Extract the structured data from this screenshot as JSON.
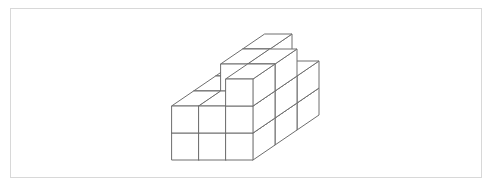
{
  "figure": {
    "kind": "line-drawing",
    "frame": {
      "visible": true,
      "border_color": "#d8d8d8",
      "background_color": "#ffffff",
      "x": 10,
      "y": 8,
      "width": 472,
      "height": 170
    },
    "line_color": "#6e6e6e",
    "fill_color": "#ffffff",
    "line_width": 1,
    "projection": {
      "type": "isometric-oblique",
      "cube_width": 27,
      "cube_height": 27,
      "depth_dx": 22,
      "depth_dy": -15,
      "origin_x": 172,
      "origin_y": 160
    },
    "grid_dimensions": {
      "x": 3,
      "y": 3,
      "z": 3
    },
    "cube_count": 22,
    "cubes": [
      {
        "x": 0,
        "y": 0,
        "z": 0
      },
      {
        "x": 1,
        "y": 0,
        "z": 0
      },
      {
        "x": 2,
        "y": 0,
        "z": 0
      },
      {
        "x": 0,
        "y": 0,
        "z": 1
      },
      {
        "x": 1,
        "y": 0,
        "z": 1
      },
      {
        "x": 2,
        "y": 0,
        "z": 1
      },
      {
        "x": 2,
        "y": 0,
        "z": 2
      },
      {
        "x": 0,
        "y": 1,
        "z": 0
      },
      {
        "x": 1,
        "y": 1,
        "z": 0
      },
      {
        "x": 2,
        "y": 1,
        "z": 0
      },
      {
        "x": 0,
        "y": 1,
        "z": 1
      },
      {
        "x": 1,
        "y": 1,
        "z": 1
      },
      {
        "x": 2,
        "y": 1,
        "z": 1
      },
      {
        "x": 1,
        "y": 1,
        "z": 2
      },
      {
        "x": 2,
        "y": 1,
        "z": 2
      },
      {
        "x": 0,
        "y": 2,
        "z": 0
      },
      {
        "x": 1,
        "y": 2,
        "z": 0
      },
      {
        "x": 2,
        "y": 2,
        "z": 0
      },
      {
        "x": 0,
        "y": 2,
        "z": 1
      },
      {
        "x": 1,
        "y": 2,
        "z": 1
      },
      {
        "x": 2,
        "y": 2,
        "z": 1
      },
      {
        "x": 1,
        "y": 2,
        "z": 2
      }
    ]
  }
}
